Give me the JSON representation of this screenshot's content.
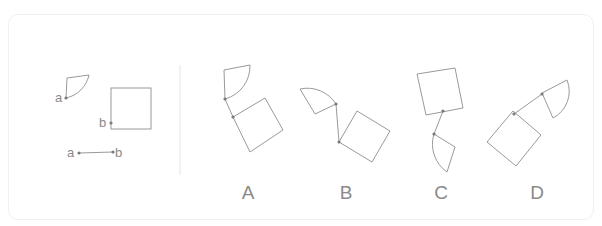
{
  "puzzle": {
    "reference": {
      "point_labels": {
        "a": "a",
        "b": "b"
      },
      "segment_labels": {
        "start": "a",
        "end": "b"
      }
    },
    "options": [
      {
        "label": "A"
      },
      {
        "label": "B"
      },
      {
        "label": "C"
      },
      {
        "label": "D"
      }
    ],
    "colors": {
      "stroke": "#9a9a9a",
      "text": "#8a8a8a",
      "dot": "#7a7a7a",
      "divider": "#e6e6e6"
    }
  }
}
